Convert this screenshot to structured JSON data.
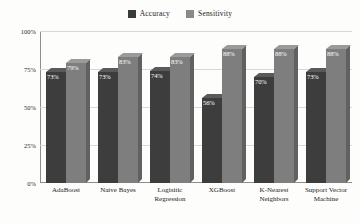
{
  "chart_data": {
    "type": "bar",
    "title": "",
    "xlabel": "",
    "ylabel": "",
    "ylim": [
      0,
      100
    ],
    "yticks": [
      "0%",
      "25%",
      "50%",
      "75%",
      "100%"
    ],
    "ytick_values": [
      0,
      25,
      50,
      75,
      100
    ],
    "grid": true,
    "legend_position": "top-center",
    "categories": [
      "AdaBoost",
      "Naive Bayes",
      "Logisitic Regression",
      "XGBoost",
      "K-Nearest Neighbors",
      "Support Vector Machine"
    ],
    "series": [
      {
        "name": "Accuracy",
        "color": "#3d3d3d",
        "values": [
          73,
          73,
          74,
          56,
          70,
          73
        ],
        "labels": [
          "73%",
          "73%",
          "74%",
          "56%",
          "70%",
          "73%"
        ]
      },
      {
        "name": "Sensitivity",
        "color": "#7e7e7e",
        "values": [
          79,
          83,
          83,
          88,
          88,
          88
        ],
        "labels": [
          "79%",
          "83%",
          "83%",
          "88%",
          "88%",
          "88%"
        ]
      }
    ]
  },
  "legend": {
    "items": [
      {
        "label": "Accuracy",
        "swatch": "accuracy-swatch"
      },
      {
        "label": "Sensitivity",
        "swatch": "sensitivity-swatch"
      }
    ]
  },
  "axis": {
    "y_labels": [
      "100%",
      "75%",
      "50%",
      "25%",
      "0%"
    ]
  }
}
